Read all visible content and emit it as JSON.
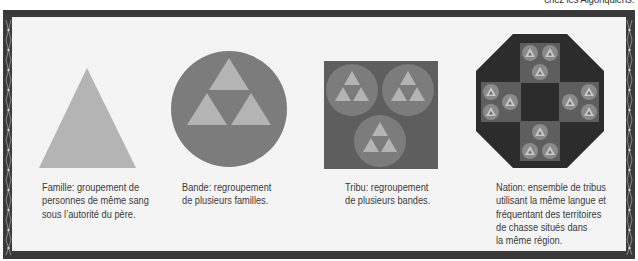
{
  "header": {
    "partial_caption": "chez les Algonquiens."
  },
  "colors": {
    "frame": "#3a3a3a",
    "panel": "#f4f4f4",
    "light_gray": "#b4b4b4",
    "mid_gray": "#7c7c7c",
    "dark_gray": "#5e5e5e",
    "darker_gray": "#4a4a4a",
    "octagon": "#2c2c2c",
    "text": "#3a3a3a"
  },
  "panels": [
    {
      "id": "famille",
      "shape": "triangle",
      "caption_lines": [
        "Famille: groupement de",
        "personnes de même sang",
        "sous l’autorité du père."
      ]
    },
    {
      "id": "bande",
      "shape": "circle-of-3-triangles",
      "caption_lines": [
        "Bande: regroupement",
        "de plusieurs familles."
      ]
    },
    {
      "id": "tribu",
      "shape": "square-of-3-circles",
      "caption_lines": [
        "Tribu: regroupement",
        "de plusieurs bandes."
      ]
    },
    {
      "id": "nation",
      "shape": "octagon-of-4-squares",
      "caption_lines": [
        "Nation: ensemble de tribus",
        "utilisant la même langue et",
        "fréquentant des territoires",
        "de chasse situés dans",
        "la même région."
      ]
    }
  ]
}
